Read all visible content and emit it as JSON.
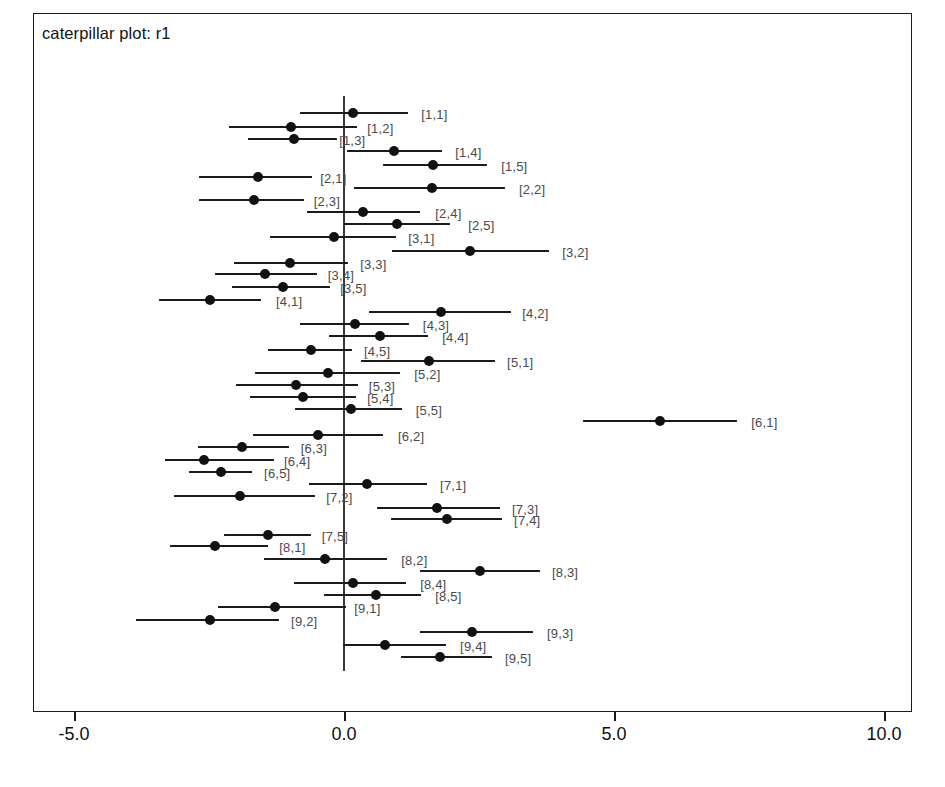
{
  "plot": {
    "title": "caterpillar plot: r1",
    "axis": {
      "ticks": [
        {
          "label": "-5.0",
          "value": -5.0
        },
        {
          "label": "0.0",
          "value": 0.0
        },
        {
          "label": "5.0",
          "value": 5.0
        },
        {
          "label": "10.0",
          "value": 10.0
        }
      ],
      "xmin": -5.85,
      "xmax": 10.45,
      "reference_line_value": 0.0
    },
    "colors": {
      "line": "#1a1a1a",
      "dot": "#111111",
      "label": "#4a4a4a",
      "frame": "#1a1a1a",
      "zero_line": "#3a3a3a",
      "background": "#ffffff"
    }
  },
  "chart_data": {
    "type": "scatter",
    "title": "caterpillar plot: r1",
    "xlabel": "",
    "ylabel": "",
    "xlim": [
      -5.85,
      10.45
    ],
    "grid": false,
    "legend": "none",
    "reference_line": 0.0,
    "annotations": [
      "vertical reference line at 0.0"
    ],
    "series_description": "posterior means with 95% credible intervals per random effect",
    "categories": [
      "[1,1]",
      "[1,2]",
      "[1,3]",
      "[1,4]",
      "[1,5]",
      "[2,1]",
      "[2,2]",
      "[2,3]",
      "[2,4]",
      "[2,5]",
      "[3,1]",
      "[3,2]",
      "[3,3]",
      "[3,4]",
      "[3,5]",
      "[4,1]",
      "[4,2]",
      "[4,3]",
      "[4,4]",
      "[4,5]",
      "[5,1]",
      "[5,2]",
      "[5,3]",
      "[5,4]",
      "[5,5]",
      "[6,1]",
      "[6,2]",
      "[6,3]",
      "[6,4]",
      "[6,5]",
      "[7,1]",
      "[7,2]",
      "[7,3]",
      "[7,4]",
      "[7,5]",
      "[8,1]",
      "[8,2]",
      "[8,3]",
      "[8,4]",
      "[8,5]",
      "[9,1]",
      "[9,2]",
      "[9,3]",
      "[9,4]",
      "[9,5]"
    ],
    "points": [
      {
        "label": "[1,1]",
        "y": 113,
        "mean": 0.17,
        "lower": -0.81,
        "upper": 1.19,
        "label_x": 1.43
      },
      {
        "label": "[1,2]",
        "y": 127,
        "mean": -0.98,
        "lower": -2.13,
        "upper": 0.24,
        "label_x": 0.43
      },
      {
        "label": "[1,3]",
        "y": 139,
        "mean": -0.93,
        "lower": -1.78,
        "upper": -0.13,
        "label_x": -0.09
      },
      {
        "label": "[1,4]",
        "y": 151,
        "mean": 0.93,
        "lower": 0.06,
        "upper": 1.81,
        "label_x": 2.06
      },
      {
        "label": "[1,5]",
        "y": 165,
        "mean": 1.65,
        "lower": 0.72,
        "upper": 2.65,
        "label_x": 2.91
      },
      {
        "label": "[2,1]",
        "y": 177,
        "mean": -1.59,
        "lower": -2.69,
        "upper": -0.59,
        "label_x": -0.44
      },
      {
        "label": "[2,2]",
        "y": 188,
        "mean": 1.63,
        "lower": 0.19,
        "upper": 2.98,
        "label_x": 3.24
      },
      {
        "label": "[2,3]",
        "y": 200,
        "mean": -1.67,
        "lower": -2.69,
        "upper": -0.74,
        "label_x": -0.56
      },
      {
        "label": "[2,4]",
        "y": 212,
        "mean": 0.35,
        "lower": -0.69,
        "upper": 1.41,
        "label_x": 1.69
      },
      {
        "label": "[2,5]",
        "y": 224,
        "mean": 0.98,
        "lower": 0.0,
        "upper": 1.96,
        "label_x": 2.3
      },
      {
        "label": "[3,1]",
        "y": 237,
        "mean": -0.19,
        "lower": -1.37,
        "upper": 0.96,
        "label_x": 1.19
      },
      {
        "label": "[3,2]",
        "y": 251,
        "mean": 2.33,
        "lower": 0.89,
        "upper": 3.8,
        "label_x": 4.04
      },
      {
        "label": "[3,3]",
        "y": 263,
        "mean": -1.0,
        "lower": -2.04,
        "upper": 0.07,
        "label_x": 0.3
      },
      {
        "label": "[3,4]",
        "y": 274,
        "mean": -1.46,
        "lower": -2.39,
        "upper": -0.5,
        "label_x": -0.3
      },
      {
        "label": "[3,5]",
        "y": 287,
        "mean": -1.13,
        "lower": -2.07,
        "upper": -0.26,
        "label_x": -0.07
      },
      {
        "label": "[4,1]",
        "y": 300,
        "mean": -2.48,
        "lower": -3.43,
        "upper": -1.54,
        "label_x": -1.26
      },
      {
        "label": "[4,2]",
        "y": 312,
        "mean": 1.8,
        "lower": 0.46,
        "upper": 3.09,
        "label_x": 3.3
      },
      {
        "label": "[4,3]",
        "y": 324,
        "mean": 0.2,
        "lower": -0.81,
        "upper": 1.2,
        "label_x": 1.46
      },
      {
        "label": "[4,4]",
        "y": 336,
        "mean": 0.67,
        "lower": -0.28,
        "upper": 1.56,
        "label_x": 1.82
      },
      {
        "label": "[4,5]",
        "y": 350,
        "mean": -0.61,
        "lower": -1.41,
        "upper": 0.15,
        "label_x": 0.37
      },
      {
        "label": "[5,1]",
        "y": 361,
        "mean": 1.57,
        "lower": 0.31,
        "upper": 2.8,
        "label_x": 3.02
      },
      {
        "label": "[5,2]",
        "y": 373,
        "mean": -0.3,
        "lower": -1.65,
        "upper": 1.04,
        "label_x": 1.3
      },
      {
        "label": "[5,3]",
        "y": 385,
        "mean": -0.89,
        "lower": -2.0,
        "upper": 0.26,
        "label_x": 0.46
      },
      {
        "label": "[5,4]",
        "y": 397,
        "mean": -0.76,
        "lower": -1.74,
        "upper": 0.22,
        "label_x": 0.43
      },
      {
        "label": "[5,5]",
        "y": 409,
        "mean": 0.13,
        "lower": -0.91,
        "upper": 1.07,
        "label_x": 1.33
      },
      {
        "label": "[6,1]",
        "y": 421,
        "mean": 5.85,
        "lower": 4.43,
        "upper": 7.28,
        "label_x": 7.54
      },
      {
        "label": "[6,2]",
        "y": 435,
        "mean": -0.48,
        "lower": -1.69,
        "upper": 0.72,
        "label_x": 1.0
      },
      {
        "label": "[6,3]",
        "y": 447,
        "mean": -1.89,
        "lower": -2.7,
        "upper": -1.02,
        "label_x": -0.8
      },
      {
        "label": "[6,4]",
        "y": 460,
        "mean": -2.59,
        "lower": -3.31,
        "upper": -1.3,
        "label_x": -1.11
      },
      {
        "label": "[6,5]",
        "y": 472,
        "mean": -2.28,
        "lower": -2.87,
        "upper": -1.7,
        "label_x": -1.48
      },
      {
        "label": "[7,1]",
        "y": 484,
        "mean": 0.43,
        "lower": -0.65,
        "upper": 1.54,
        "label_x": 1.78
      },
      {
        "label": "[7,2]",
        "y": 496,
        "mean": -1.93,
        "lower": -3.15,
        "upper": -0.54,
        "label_x": -0.33
      },
      {
        "label": "[7,3]",
        "y": 508,
        "mean": 1.72,
        "lower": 0.61,
        "upper": 2.89,
        "label_x": 3.11
      },
      {
        "label": "[7,4]",
        "y": 519,
        "mean": 1.91,
        "lower": 0.87,
        "upper": 2.93,
        "label_x": 3.15
      },
      {
        "label": "[7,5]",
        "y": 535,
        "mean": -1.41,
        "lower": -2.22,
        "upper": -0.61,
        "label_x": -0.41
      },
      {
        "label": "[8,1]",
        "y": 546,
        "mean": -2.39,
        "lower": -3.22,
        "upper": -1.41,
        "label_x": -1.2
      },
      {
        "label": "[8,2]",
        "y": 559,
        "mean": -0.35,
        "lower": -1.48,
        "upper": 0.8,
        "label_x": 1.06
      },
      {
        "label": "[8,3]",
        "y": 571,
        "mean": 2.52,
        "lower": 1.41,
        "upper": 3.63,
        "label_x": 3.85
      },
      {
        "label": "[8,4]",
        "y": 583,
        "mean": 0.17,
        "lower": -0.93,
        "upper": 1.15,
        "label_x": 1.41
      },
      {
        "label": "[8,5]",
        "y": 595,
        "mean": 0.59,
        "lower": -0.37,
        "upper": 1.43,
        "label_x": 1.69
      },
      {
        "label": "[9,1]",
        "y": 607,
        "mean": -1.28,
        "lower": -2.33,
        "upper": 0.04,
        "label_x": 0.19
      },
      {
        "label": "[9,2]",
        "y": 620,
        "mean": -2.48,
        "lower": -3.85,
        "upper": -1.2,
        "label_x": -0.98
      },
      {
        "label": "[9,3]",
        "y": 632,
        "mean": 2.37,
        "lower": 1.41,
        "upper": 3.5,
        "label_x": 3.76
      },
      {
        "label": "[9,4]",
        "y": 645,
        "mean": 0.76,
        "lower": -0.02,
        "upper": 1.89,
        "label_x": 2.15
      },
      {
        "label": "[9,5]",
        "y": 657,
        "mean": 1.78,
        "lower": 1.06,
        "upper": 2.74,
        "label_x": 2.98
      }
    ]
  }
}
